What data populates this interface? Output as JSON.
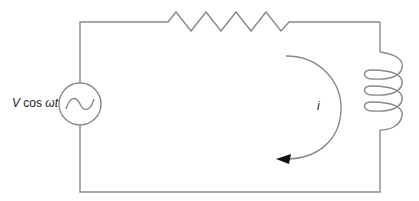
{
  "diagram": {
    "colors": {
      "wire": "#8a8a8a",
      "arrow": "#111111",
      "text": "#222222",
      "background": "#ffffff"
    },
    "components": [
      {
        "type": "ac-voltage-source",
        "label": "V cos ωt",
        "position": "left"
      },
      {
        "type": "resistor",
        "position": "top"
      },
      {
        "type": "inductor",
        "position": "right"
      },
      {
        "type": "current-arrow",
        "label": "i",
        "direction": "clockwise"
      }
    ],
    "source": {
      "label_v": "V",
      "label_rest": " cos ",
      "label_omega_t": "ωt"
    },
    "current": {
      "label": "i"
    }
  }
}
